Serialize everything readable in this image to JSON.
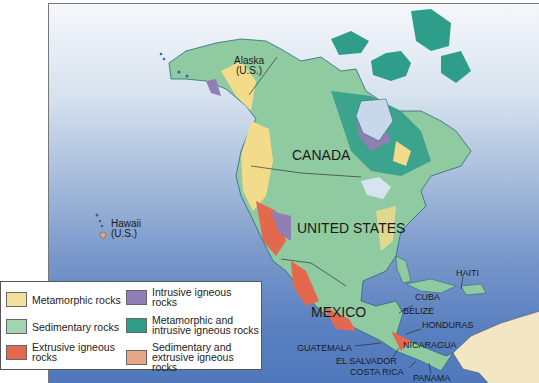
{
  "map": {
    "labels": {
      "alaska": "Alaska",
      "alaska_us": "(U.S.)",
      "canada": "CANADA",
      "united_states": "UNITED STATES",
      "mexico": "MEXICO",
      "hawaii": "Hawaii",
      "hawaii_us": "(U.S.)",
      "haiti": "HAITI",
      "cuba": "CUBA",
      "belize": "BELIZE",
      "honduras": "HONDURAS",
      "guatemala": "GUATEMALA",
      "nicaragua": "NICARAGUA",
      "el_salvador": "EL SALVADOR",
      "costa_rica": "COSTA RICA",
      "panama": "PANAMA"
    },
    "colors": {
      "ocean_top": "#f5f8fb",
      "ocean_bottom": "#4f78bc",
      "sedimentary": "#8fcaa0",
      "metamorphic": "#f2dc8c",
      "extrusive": "#e4684e",
      "intrusive": "#8f7fb5",
      "metamorphic_intrusive": "#2e9e8a",
      "sedimentary_extrusive": "#e8a080",
      "south_america": "#f3e6c4"
    }
  },
  "legend": {
    "items": [
      {
        "label": "Metamorphic rocks",
        "color": "#f4e09c"
      },
      {
        "label": "Sedimentary rocks",
        "color": "#a3d4b0"
      },
      {
        "label": "Extrusive igneous rocks",
        "color": "#e4684e"
      },
      {
        "label": "Intrusive igneous rocks",
        "color": "#8f7fb5"
      },
      {
        "label": "Metamorphic and intrusive igneous rocks",
        "color": "#2e9e8a"
      },
      {
        "label": "Sedimentary and extrusive igneous rocks",
        "color": "#e8a888"
      }
    ],
    "lines": {
      "extrusive_1": "Extrusive igneous",
      "extrusive_2": "rocks",
      "intrusive_1": "Intrusive igneous",
      "intrusive_2": "rocks",
      "metint_1": "Metamorphic and",
      "metint_2": "intrusive igneous rocks",
      "sedext_1": "Sedimentary and",
      "sedext_2": "extrusive igneous rocks"
    }
  }
}
